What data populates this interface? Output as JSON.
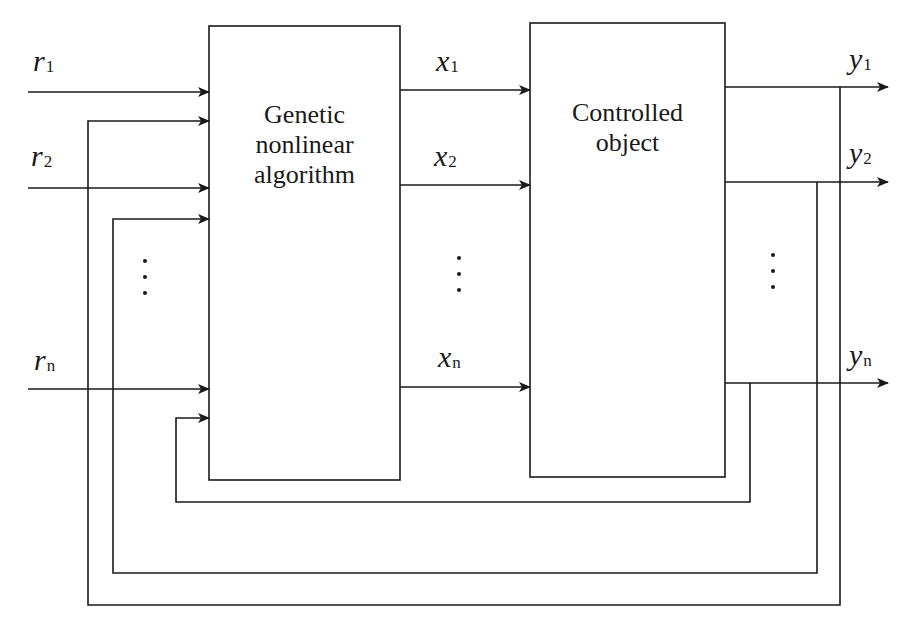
{
  "diagram": {
    "type": "block-diagram",
    "blocks": {
      "controller": {
        "lines": [
          "Genetic",
          "nonlinear",
          "algorithm"
        ]
      },
      "plant": {
        "lines": [
          "Controlled",
          "object"
        ]
      }
    },
    "inputs": [
      {
        "var": "r",
        "sub": "1"
      },
      {
        "var": "r",
        "sub": "2"
      },
      {
        "var": "r",
        "sub": "n"
      }
    ],
    "intermediate": [
      {
        "var": "x",
        "sub": "1"
      },
      {
        "var": "x",
        "sub": "2"
      },
      {
        "var": "x",
        "sub": "n"
      }
    ],
    "outputs": [
      {
        "var": "y",
        "sub": "1"
      },
      {
        "var": "y",
        "sub": "2"
      },
      {
        "var": "y",
        "sub": "n"
      }
    ],
    "edges": [
      "r1 -> Genetic nonlinear algorithm",
      "r2 -> Genetic nonlinear algorithm",
      "rn -> Genetic nonlinear algorithm",
      "Genetic nonlinear algorithm -> x1 -> Controlled object",
      "Genetic nonlinear algorithm -> x2 -> Controlled object",
      "Genetic nonlinear algorithm -> xn -> Controlled object",
      "Controlled object -> y1",
      "Controlled object -> y2",
      "Controlled object -> yn",
      "y1 feedback -> Genetic nonlinear algorithm",
      "y2 feedback -> Genetic nonlinear algorithm",
      "yn feedback -> Genetic nonlinear algorithm"
    ],
    "colors": {
      "line": "#1a1a1a",
      "background": "#ffffff"
    }
  }
}
